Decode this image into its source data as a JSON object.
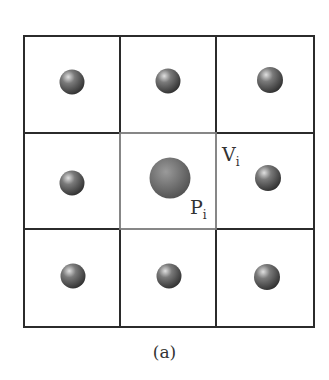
{
  "figure": {
    "caption": "(a)",
    "grid": {
      "rows": 3,
      "cols": 3,
      "center_cell": [
        1,
        1
      ]
    },
    "labels": {
      "voronoi_cell": {
        "main": "V",
        "sub": "i"
      },
      "particle": {
        "main": "P",
        "sub": "i"
      }
    },
    "colors": {
      "outer_lines": "#2b2b2b",
      "center_lines": "#7a7a7a",
      "sphere_dark": "#3a3a3a",
      "sphere_mid": "#6e6e6e",
      "sphere_light": "#d8d8d8",
      "center_sphere": "#6a6a6a"
    }
  }
}
